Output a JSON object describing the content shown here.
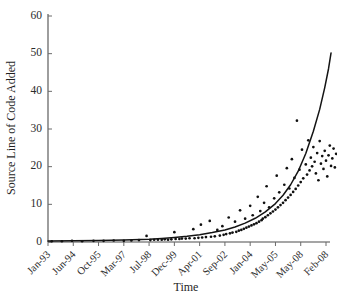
{
  "chart_data": {
    "type": "scatter",
    "title": "",
    "xlabel": "Time",
    "ylabel": "Source Line of Code Added",
    "grid": false,
    "legend": null,
    "ylim": [
      0,
      60
    ],
    "yticks": [
      0,
      10,
      20,
      30,
      40,
      50,
      60
    ],
    "xtick_labels": [
      "Jan-93",
      "Jun-94",
      "Oct-95",
      "Mar-97",
      "Jul-98",
      "Dec-99",
      "Apr-01",
      "Sep-02",
      "Jan-04",
      "May-05",
      "May-08",
      "Feb-08"
    ],
    "xlim_index": [
      0,
      11
    ],
    "series": [
      {
        "name": "Source Line of Code Added",
        "marker": "dot",
        "color": "#101010",
        "points": [
          [
            0.15,
            0.2
          ],
          [
            0.55,
            0.2
          ],
          [
            0.95,
            0.3
          ],
          [
            1.35,
            0.2
          ],
          [
            1.8,
            0.3
          ],
          [
            2.2,
            0.3
          ],
          [
            2.6,
            0.4
          ],
          [
            3.0,
            0.3
          ],
          [
            3.3,
            0.4
          ],
          [
            3.6,
            0.5
          ],
          [
            3.9,
            1.6
          ],
          [
            4.05,
            0.5
          ],
          [
            4.2,
            0.6
          ],
          [
            4.35,
            0.6
          ],
          [
            4.5,
            0.6
          ],
          [
            4.62,
            0.7
          ],
          [
            4.75,
            0.6
          ],
          [
            4.88,
            0.7
          ],
          [
            5.0,
            2.6
          ],
          [
            5.05,
            0.8
          ],
          [
            5.2,
            0.8
          ],
          [
            5.3,
            0.9
          ],
          [
            5.45,
            0.9
          ],
          [
            5.6,
            1.0
          ],
          [
            5.75,
            3.4
          ],
          [
            5.8,
            1.0
          ],
          [
            5.95,
            1.1
          ],
          [
            6.05,
            4.6
          ],
          [
            6.1,
            1.2
          ],
          [
            6.25,
            1.3
          ],
          [
            6.4,
            5.6
          ],
          [
            6.45,
            1.4
          ],
          [
            6.6,
            1.5
          ],
          [
            6.7,
            3.2
          ],
          [
            6.8,
            1.7
          ],
          [
            6.9,
            4.2
          ],
          [
            6.95,
            1.9
          ],
          [
            7.05,
            2.1
          ],
          [
            7.15,
            6.5
          ],
          [
            7.2,
            2.3
          ],
          [
            7.3,
            2.5
          ],
          [
            7.4,
            5.4
          ],
          [
            7.45,
            2.7
          ],
          [
            7.55,
            3.0
          ],
          [
            7.6,
            8.4
          ],
          [
            7.65,
            3.2
          ],
          [
            7.75,
            3.5
          ],
          [
            7.8,
            6.2
          ],
          [
            7.85,
            3.8
          ],
          [
            7.95,
            4.1
          ],
          [
            8.0,
            9.6
          ],
          [
            8.05,
            4.4
          ],
          [
            8.1,
            7.1
          ],
          [
            8.15,
            4.7
          ],
          [
            8.25,
            5.0
          ],
          [
            8.3,
            12.0
          ],
          [
            8.35,
            5.4
          ],
          [
            8.4,
            8.2
          ],
          [
            8.45,
            5.8
          ],
          [
            8.5,
            6.2
          ],
          [
            8.55,
            10.4
          ],
          [
            8.6,
            6.6
          ],
          [
            8.65,
            14.8
          ],
          [
            8.7,
            7.1
          ],
          [
            8.75,
            9.2
          ],
          [
            8.8,
            7.6
          ],
          [
            8.9,
            8.1
          ],
          [
            8.95,
            11.6
          ],
          [
            9.0,
            8.6
          ],
          [
            9.05,
            17.6
          ],
          [
            9.1,
            9.2
          ],
          [
            9.15,
            13.2
          ],
          [
            9.2,
            9.8
          ],
          [
            9.3,
            10.4
          ],
          [
            9.35,
            15.2
          ],
          [
            9.4,
            11.1
          ],
          [
            9.45,
            19.6
          ],
          [
            9.5,
            11.8
          ],
          [
            9.55,
            14.2
          ],
          [
            9.6,
            12.5
          ],
          [
            9.65,
            22.0
          ],
          [
            9.7,
            13.3
          ],
          [
            9.75,
            17.0
          ],
          [
            9.8,
            14.1
          ],
          [
            9.85,
            32.2
          ],
          [
            9.9,
            15.0
          ],
          [
            9.95,
            19.2
          ],
          [
            10.0,
            15.9
          ],
          [
            10.05,
            24.5
          ],
          [
            10.1,
            16.9
          ],
          [
            10.2,
            20.6
          ],
          [
            10.25,
            17.9
          ],
          [
            10.3,
            27.0
          ],
          [
            10.35,
            19.0
          ],
          [
            10.4,
            22.4
          ],
          [
            10.45,
            20.1
          ],
          [
            10.5,
            25.2
          ],
          [
            10.55,
            21.3
          ],
          [
            10.6,
            18.2
          ],
          [
            10.65,
            23.6
          ],
          [
            10.7,
            16.4
          ],
          [
            10.75,
            26.8
          ],
          [
            10.8,
            20.8
          ],
          [
            10.85,
            22.8
          ],
          [
            10.9,
            19.4
          ],
          [
            10.95,
            24.2
          ],
          [
            11.0,
            21.6
          ],
          [
            11.05,
            17.4
          ],
          [
            11.1,
            23.0
          ],
          [
            11.15,
            25.6
          ],
          [
            11.2,
            20.2
          ],
          [
            11.25,
            22.2
          ],
          [
            11.3,
            24.8
          ],
          [
            11.35,
            19.8
          ],
          [
            11.4,
            23.4
          ]
        ]
      }
    ],
    "fit_curve": {
      "name": "exponential trend",
      "color": "#141414",
      "points": [
        [
          0.0,
          0.25
        ],
        [
          1.0,
          0.3
        ],
        [
          2.0,
          0.38
        ],
        [
          3.0,
          0.5
        ],
        [
          4.0,
          0.75
        ],
        [
          4.5,
          0.95
        ],
        [
          5.0,
          1.2
        ],
        [
          5.5,
          1.5
        ],
        [
          6.0,
          1.95
        ],
        [
          6.5,
          2.5
        ],
        [
          7.0,
          3.2
        ],
        [
          7.4,
          4.0
        ],
        [
          7.8,
          5.0
        ],
        [
          8.2,
          6.3
        ],
        [
          8.6,
          8.0
        ],
        [
          9.0,
          10.2
        ],
        [
          9.3,
          12.4
        ],
        [
          9.6,
          15.2
        ],
        [
          9.9,
          18.8
        ],
        [
          10.2,
          23.5
        ],
        [
          10.5,
          29.4
        ],
        [
          10.75,
          35.2
        ],
        [
          10.95,
          41.0
        ],
        [
          11.1,
          46.0
        ],
        [
          11.2,
          50.2
        ]
      ]
    }
  }
}
